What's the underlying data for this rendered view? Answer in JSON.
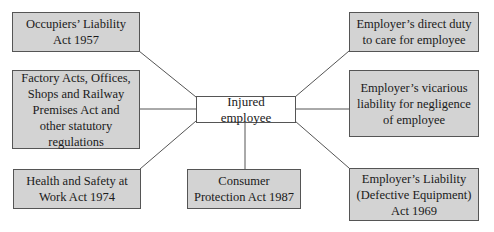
{
  "diagram": {
    "center": {
      "label": "Injured employee"
    },
    "nodes": [
      {
        "id": "occupiers",
        "label": "Occupiers’ Liability Act 1957"
      },
      {
        "id": "factory",
        "label": "Factory Acts, Offices, Shops and Railway Premises Act and other statutory regulations"
      },
      {
        "id": "hsw",
        "label": "Health and Safety at Work Act 1974"
      },
      {
        "id": "consumer",
        "label": "Consumer Protection Act 1987"
      },
      {
        "id": "direct",
        "label": "Employer’s direct duty to care for employee"
      },
      {
        "id": "vicarious",
        "label": "Employer’s vicarious liability for negligence of employee"
      },
      {
        "id": "eld",
        "label": "Employer’s Liability (Defective Equipment) Act 1969"
      }
    ],
    "colors": {
      "node_fill": "#d3d3d3",
      "center_fill": "#ffffff",
      "border": "#555555",
      "line": "#555555"
    }
  }
}
